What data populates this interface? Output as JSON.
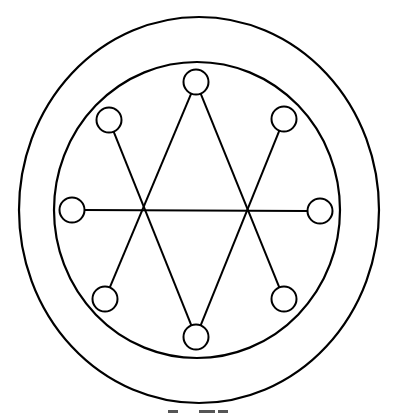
{
  "diagram": {
    "stroke_color": "#000000",
    "background_color": "#ffffff",
    "node_count": 8,
    "nodes": [
      {
        "id": "top",
        "label": ""
      },
      {
        "id": "upper-left",
        "label": ""
      },
      {
        "id": "upper-right",
        "label": ""
      },
      {
        "id": "left",
        "label": ""
      },
      {
        "id": "right",
        "label": ""
      },
      {
        "id": "lower-left",
        "label": ""
      },
      {
        "id": "lower-right",
        "label": ""
      },
      {
        "id": "bottom",
        "label": ""
      }
    ],
    "connections": [
      {
        "from": "top",
        "to": "lower-left"
      },
      {
        "from": "top",
        "to": "lower-right"
      },
      {
        "from": "bottom",
        "to": "upper-left"
      },
      {
        "from": "bottom",
        "to": "upper-right"
      },
      {
        "from": "left",
        "to": "right"
      }
    ]
  }
}
